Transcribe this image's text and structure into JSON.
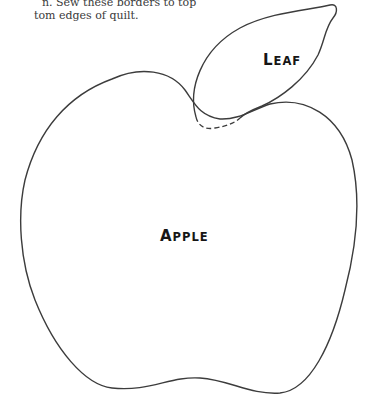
{
  "instructions": {
    "line1": "n. Sew these borders to top",
    "line2": "tom edges of quilt."
  },
  "shapes": {
    "leaf": {
      "label_first": "L",
      "label_rest": "EAF"
    },
    "apple": {
      "label_first": "A",
      "label_rest": "PPLE"
    }
  },
  "colors": {
    "outline": "#3c3c3c",
    "background": "#ffffff"
  }
}
